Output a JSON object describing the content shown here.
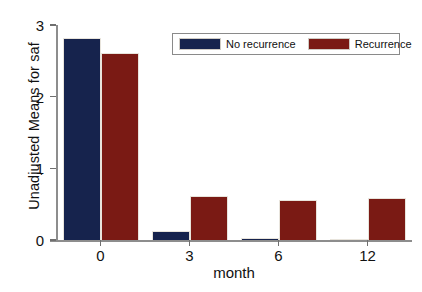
{
  "chart_data": {
    "type": "bar",
    "title": "",
    "subtitle": "",
    "xlabel": "month",
    "ylabel": "Unadjusted Means for saf",
    "categories": [
      "0",
      "3",
      "6",
      "12"
    ],
    "series": [
      {
        "name": "No recurrence",
        "color": "#16234d",
        "values": [
          2.82,
          0.12,
          0.03,
          0.01
        ]
      },
      {
        "name": "Recurrence",
        "color": "#7a1a14",
        "values": [
          2.61,
          0.62,
          0.56,
          0.59
        ]
      }
    ],
    "ylim": [
      0,
      3
    ],
    "yticks": [
      0,
      1,
      2,
      3
    ],
    "yticklabels": [
      "0",
      "1",
      "2",
      "3"
    ],
    "xticklabels": [
      "0",
      "3",
      "6",
      "12"
    ],
    "grid": false,
    "legend_position": "top-center",
    "legend_entries": [
      "No recurrence",
      "Recurrence"
    ]
  }
}
